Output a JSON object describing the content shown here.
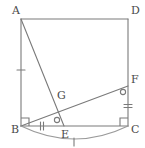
{
  "figure": {
    "kind": "euclidean-geometry-diagram",
    "canvas": {
      "width": 145,
      "height": 148
    },
    "colors": {
      "background": "#ffffff",
      "stroke": "#7a7a7a",
      "stroke_light": "#9a9a9a",
      "label": "#4a4a4a"
    },
    "stroke_width": 1.1,
    "points": [
      {
        "id": "A",
        "label": "A",
        "x": 21,
        "y": 19,
        "label_x": 12,
        "label_y": 14
      },
      {
        "id": "D",
        "label": "D",
        "x": 128,
        "y": 19,
        "label_x": 131,
        "label_y": 14
      },
      {
        "id": "B",
        "label": "B",
        "x": 21,
        "y": 126,
        "label_x": 11,
        "label_y": 133
      },
      {
        "id": "C",
        "label": "C",
        "x": 128,
        "y": 126,
        "label_x": 131,
        "label_y": 133
      },
      {
        "id": "E",
        "label": "E",
        "x": 64,
        "y": 126,
        "label_x": 61,
        "label_y": 138
      },
      {
        "id": "F",
        "label": "F",
        "x": 128,
        "y": 86,
        "label_x": 131,
        "label_y": 83
      },
      {
        "id": "G",
        "label": "G",
        "x": 62,
        "y": 101,
        "label_x": 57,
        "label_y": 99
      }
    ],
    "segments": [
      {
        "id": "AD",
        "from": "A",
        "to": "D",
        "name": "segment-ad"
      },
      {
        "id": "DC",
        "from": "D",
        "to": "C",
        "name": "segment-dc"
      },
      {
        "id": "CB",
        "from": "C",
        "to": "B",
        "name": "segment-cb"
      },
      {
        "id": "BA",
        "from": "B",
        "to": "A",
        "name": "segment-ba"
      },
      {
        "id": "AE",
        "from": "A",
        "to": "E",
        "name": "segment-ae"
      },
      {
        "id": "BF",
        "from": "B",
        "to": "F",
        "name": "segment-bf"
      }
    ],
    "arcs": [
      {
        "id": "arc-BC",
        "name": "arc-b-to-c",
        "path": "M 21 126 Q 74.5 152 128 126",
        "tick_count": 1
      }
    ],
    "right_angle_marks": [
      {
        "id": "right-angle-B",
        "name": "right-angle-mark-b",
        "x": 21,
        "y": 126,
        "dir_x": 1,
        "dir_y": -1,
        "size": 8
      },
      {
        "id": "right-angle-C",
        "name": "right-angle-mark-c",
        "x": 128,
        "y": 126,
        "dir_x": -1,
        "dir_y": -1,
        "size": 8
      }
    ],
    "angle_circle_marks": [
      {
        "id": "angle-mark-E",
        "name": "angle-mark-at-e",
        "cx": 57,
        "cy": 120,
        "r": 2.6
      },
      {
        "id": "angle-mark-F",
        "name": "angle-mark-at-f",
        "cx": 123,
        "cy": 92,
        "r": 2.6
      }
    ],
    "tick_marks": [
      {
        "id": "tick-AB",
        "name": "tick-mark-segment-ab",
        "cx": 21,
        "cy": 70,
        "angle": 90,
        "count": 1,
        "length": 8
      },
      {
        "id": "tick-BE",
        "name": "tick-mark-segment-be",
        "cx": 42,
        "cy": 126,
        "angle": 0,
        "count": 2,
        "length": 8
      },
      {
        "id": "tick-FC",
        "name": "tick-mark-segment-fc",
        "cx": 128,
        "cy": 106,
        "angle": 90,
        "count": 2,
        "length": 8
      },
      {
        "id": "tick-arc",
        "name": "tick-mark-arc-bc",
        "cx": 74,
        "cy": 142,
        "angle": 0,
        "count": 1,
        "length": 8
      }
    ]
  }
}
